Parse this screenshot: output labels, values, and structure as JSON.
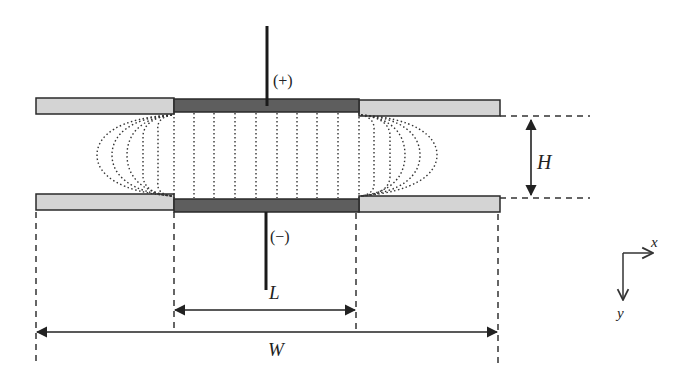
{
  "diagram": {
    "labels": {
      "positive": "(+)",
      "negative": "(−)",
      "height": "H",
      "electrode_length": "L",
      "total_width": "W",
      "axis_x": "x",
      "axis_y": "y"
    },
    "colors": {
      "insulator_fill": "#d4d4d4",
      "electrode_fill": "#5e5e5e",
      "outline": "#2a2a2a",
      "field_lines": "#333333",
      "dashes": "#333333"
    },
    "geometry": {
      "plate_left": 36,
      "plate_right": 500,
      "electrode_left": 174,
      "electrode_right": 359,
      "top_plate_y": [
        98,
        114
      ],
      "bottom_plate_y": [
        196,
        211
      ],
      "field_line_x": [
        174,
        194,
        214,
        235,
        256,
        277,
        297,
        317,
        338,
        359
      ]
    }
  }
}
